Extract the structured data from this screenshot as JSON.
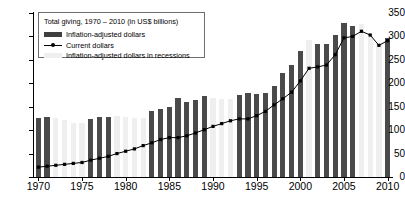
{
  "chart_data": {
    "type": "bar",
    "title": "Total giving, 1970 – 2010 (in US$ billions)",
    "xlabel": "",
    "ylabel": "",
    "ylim": [
      0,
      350
    ],
    "xlim": [
      1970,
      2010
    ],
    "grid": false,
    "legend_position": "top-left inside plot",
    "y_ticks": [
      "0",
      "50",
      "100",
      "150",
      "200",
      "250",
      "300",
      "350"
    ],
    "x_ticks": [
      "1970",
      "1975",
      "1980",
      "1985",
      "1990",
      "1995",
      "2000",
      "2005",
      "2010"
    ],
    "years": [
      1970,
      1971,
      1972,
      1973,
      1974,
      1975,
      1976,
      1977,
      1978,
      1979,
      1980,
      1981,
      1982,
      1983,
      1984,
      1985,
      1986,
      1987,
      1988,
      1989,
      1990,
      1991,
      1992,
      1993,
      1994,
      1995,
      1996,
      1997,
      1998,
      1999,
      2000,
      2001,
      2002,
      2003,
      2004,
      2005,
      2006,
      2007,
      2008,
      2009,
      2010
    ],
    "series": [
      {
        "name": "Inflation-adjusted dollars",
        "type": "bar",
        "color": "#4a4a4a",
        "values": [
          127,
          128,
          126,
          121,
          116,
          116,
          123,
          128,
          129,
          130,
          128,
          127,
          127,
          140,
          146,
          149,
          168,
          160,
          164,
          173,
          168,
          167,
          167,
          175,
          179,
          178,
          179,
          194,
          223,
          239,
          268,
          293,
          284,
          284,
          304,
          329,
          322,
          326,
          306,
          283,
          296
        ]
      },
      {
        "name": "Inflation-adjusted dollars in recessions",
        "type": "bar-highlight",
        "color": "#efefef",
        "recession_years": [
          1972,
          1973,
          1974,
          1975,
          1979,
          1980,
          1981,
          1982,
          1990,
          1991,
          1992,
          2001,
          2007,
          2008,
          2009
        ]
      },
      {
        "name": "Current dollars",
        "type": "line",
        "color": "#000000",
        "marker": "square",
        "values": [
          21,
          23,
          25,
          27,
          29,
          31,
          36,
          40,
          44,
          50,
          55,
          60,
          67,
          73,
          80,
          84,
          84,
          88,
          94,
          101,
          108,
          114,
          120,
          124,
          124,
          131,
          140,
          154,
          167,
          181,
          205,
          232,
          235,
          239,
          261,
          297,
          300,
          311,
          303,
          281,
          291
        ]
      }
    ]
  },
  "legend": {
    "title": "Total giving, 1970 – 2010 (in US$ billions)",
    "items": [
      {
        "label": "Inflation-adjusted dollars",
        "swatch": "normal"
      },
      {
        "label": "Current dollars",
        "swatch": "line"
      },
      {
        "label": "Inflation-adjusted dollars in recessions",
        "swatch": "recession"
      }
    ]
  },
  "colors": {
    "bar_normal": "#4a4a4a",
    "bar_recession": "#efefef",
    "line": "#000000",
    "axis": "#000000",
    "background": "#ffffff"
  }
}
